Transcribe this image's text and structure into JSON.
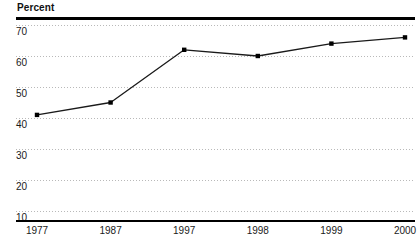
{
  "axis_title": "Percent",
  "chart_data": {
    "type": "line",
    "title": "",
    "subtitle": "",
    "xlabel": "",
    "ylabel": "Percent",
    "categories": [
      "1977",
      "1987",
      "1997",
      "1998",
      "1999",
      "2000"
    ],
    "values": [
      41,
      45,
      62,
      60,
      64,
      66
    ],
    "series": [
      {
        "name": "Percent",
        "values": [
          41,
          45,
          62,
          60,
          64,
          66
        ]
      }
    ],
    "ylim": [
      10,
      70
    ],
    "yticks": [
      70,
      60,
      50,
      40,
      30,
      20,
      10
    ],
    "ytick_labels": [
      "70",
      "60",
      "50",
      "40",
      "30",
      "20",
      "10"
    ],
    "xtick_labels": [
      "1977",
      "1987",
      "1997",
      "1998",
      "1999",
      "2000"
    ],
    "grid": true,
    "grid_axis": "y",
    "grid_style": "dotted",
    "legend": false,
    "legend_position": "none",
    "marker": "square",
    "line_color": "#1a1a1a",
    "marker_color": "#000000",
    "grid_color": "#b9b9b9",
    "rule_color": "#000000",
    "background": "#ffffff",
    "annotations": []
  }
}
